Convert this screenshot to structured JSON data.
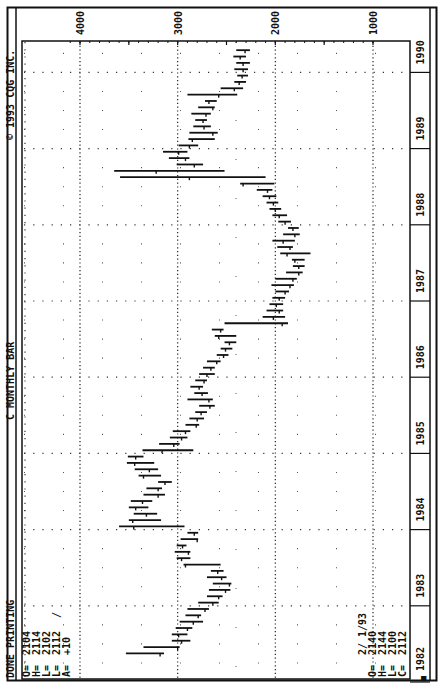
{
  "header": {
    "status": "DONE PRINTING",
    "title": "C MONTHLY BAR",
    "copyright": "© 1993 CQG INC."
  },
  "quote_current": {
    "labels": [
      "O=",
      "H=",
      "L=",
      "L=",
      "A="
    ],
    "values": [
      "2104",
      "2114",
      "2102",
      "2112",
      "+10"
    ],
    "tick_mark": "/"
  },
  "quote_cursor": {
    "date": "2/ 1/93",
    "labels": [
      "O=",
      "H=",
      "L=",
      "C="
    ],
    "values": [
      "2140",
      "2144",
      "2100",
      "2112"
    ]
  },
  "corner_marker": "■",
  "chart_data": {
    "type": "ohlc-bar",
    "title": "C MONTHLY BAR",
    "orientation": "rotated 90° counter-clockwise (price axis across top, time axis along right edge)",
    "xlabel": "Year",
    "ylabel": "Price",
    "ylim": [
      1000,
      4100
    ],
    "price_ticks": [
      4000,
      3000,
      2000,
      1000
    ],
    "year_ticks": [
      "1982",
      "1983",
      "1984",
      "1985",
      "1986",
      "1987",
      "1988",
      "1989",
      "1990",
      "1991",
      "1992",
      "1993"
    ],
    "grid": "dotted",
    "months": [
      {
        "t": "1982-05",
        "h": 3530,
        "l": 3140,
        "c": 3180
      },
      {
        "t": "1982-06",
        "h": 3350,
        "l": 2980,
        "c": 3000
      },
      {
        "t": "1982-07",
        "h": 3060,
        "l": 2870,
        "c": 2960
      },
      {
        "t": "1982-08",
        "h": 3060,
        "l": 2900,
        "c": 2990
      },
      {
        "t": "1982-09",
        "h": 3020,
        "l": 2850,
        "c": 2900
      },
      {
        "t": "1982-10",
        "h": 2980,
        "l": 2740,
        "c": 2840
      },
      {
        "t": "1982-11",
        "h": 2920,
        "l": 2760,
        "c": 2790
      },
      {
        "t": "1982-12",
        "h": 2900,
        "l": 2680,
        "c": 2720
      },
      {
        "t": "1983-01",
        "h": 2790,
        "l": 2580,
        "c": 2640
      },
      {
        "t": "1983-02",
        "h": 2700,
        "l": 2540,
        "c": 2580
      },
      {
        "t": "1983-03",
        "h": 2680,
        "l": 2460,
        "c": 2510
      },
      {
        "t": "1983-04",
        "h": 2640,
        "l": 2450,
        "c": 2470
      },
      {
        "t": "1983-05",
        "h": 2700,
        "l": 2500,
        "c": 2550
      },
      {
        "t": "1983-06",
        "h": 2660,
        "l": 2530,
        "c": 2590
      },
      {
        "t": "1983-07",
        "h": 2940,
        "l": 2560,
        "c": 2920
      },
      {
        "t": "1983-08",
        "h": 3010,
        "l": 2870,
        "c": 2960
      },
      {
        "t": "1983-09",
        "h": 3030,
        "l": 2870,
        "c": 2890
      },
      {
        "t": "1983-10",
        "h": 3010,
        "l": 2910,
        "c": 2950
      },
      {
        "t": "1983-11",
        "h": 2970,
        "l": 2790,
        "c": 2800
      },
      {
        "t": "1983-12",
        "h": 2900,
        "l": 2790,
        "c": 2830
      },
      {
        "t": "1984-01",
        "h": 3600,
        "l": 2930,
        "c": 3450
      },
      {
        "t": "1984-02",
        "h": 3500,
        "l": 3170,
        "c": 3460
      },
      {
        "t": "1984-03",
        "h": 3450,
        "l": 3210,
        "c": 3320
      },
      {
        "t": "1984-04",
        "h": 3500,
        "l": 3300,
        "c": 3430
      },
      {
        "t": "1984-05",
        "h": 3480,
        "l": 3260,
        "c": 3360
      },
      {
        "t": "1984-06",
        "h": 3350,
        "l": 3130,
        "c": 3200
      },
      {
        "t": "1984-07",
        "h": 3320,
        "l": 3160,
        "c": 3200
      },
      {
        "t": "1984-08",
        "h": 3200,
        "l": 3060,
        "c": 3130
      },
      {
        "t": "1984-09",
        "h": 3400,
        "l": 3170,
        "c": 3350
      },
      {
        "t": "1984-10",
        "h": 3440,
        "l": 3200,
        "c": 3290
      },
      {
        "t": "1984-11",
        "h": 3520,
        "l": 3240,
        "c": 3440
      },
      {
        "t": "1984-12",
        "h": 3510,
        "l": 3350,
        "c": 3430
      },
      {
        "t": "1985-01",
        "h": 3360,
        "l": 2840,
        "c": 3160
      },
      {
        "t": "1985-02",
        "h": 3190,
        "l": 2980,
        "c": 3040
      },
      {
        "t": "1985-03",
        "h": 3080,
        "l": 2900,
        "c": 2960
      },
      {
        "t": "1985-04",
        "h": 3050,
        "l": 2870,
        "c": 2920
      },
      {
        "t": "1985-05",
        "h": 2920,
        "l": 2780,
        "c": 2810
      },
      {
        "t": "1985-06",
        "h": 2880,
        "l": 2730,
        "c": 2800
      },
      {
        "t": "1985-07",
        "h": 2820,
        "l": 2700,
        "c": 2760
      },
      {
        "t": "1985-08",
        "h": 2780,
        "l": 2620,
        "c": 2670
      },
      {
        "t": "1985-09",
        "h": 2900,
        "l": 2640,
        "c": 2680
      },
      {
        "t": "1985-10",
        "h": 2830,
        "l": 2690,
        "c": 2750
      },
      {
        "t": "1985-11",
        "h": 2870,
        "l": 2740,
        "c": 2780
      },
      {
        "t": "1985-12",
        "h": 2820,
        "l": 2700,
        "c": 2730
      },
      {
        "t": "1986-01",
        "h": 2780,
        "l": 2620,
        "c": 2700
      },
      {
        "t": "1986-02",
        "h": 2740,
        "l": 2620,
        "c": 2660
      },
      {
        "t": "1986-03",
        "h": 2700,
        "l": 2560,
        "c": 2600
      },
      {
        "t": "1986-04",
        "h": 2600,
        "l": 2480,
        "c": 2530
      },
      {
        "t": "1986-05",
        "h": 2560,
        "l": 2440,
        "c": 2510
      },
      {
        "t": "1986-06",
        "h": 2520,
        "l": 2400,
        "c": 2470
      },
      {
        "t": "1986-07",
        "h": 2620,
        "l": 2400,
        "c": 2580
      },
      {
        "t": "1986-08",
        "h": 2650,
        "l": 2530,
        "c": 2560
      },
      {
        "t": "1986-09",
        "h": 2520,
        "l": 1870,
        "c": 1930
      },
      {
        "t": "1986-10",
        "h": 2130,
        "l": 1900,
        "c": 2020
      },
      {
        "t": "1986-11",
        "h": 2090,
        "l": 1920,
        "c": 1960
      },
      {
        "t": "1986-12",
        "h": 2060,
        "l": 1920,
        "c": 1990
      },
      {
        "t": "1987-01",
        "h": 2030,
        "l": 1900,
        "c": 1960
      },
      {
        "t": "1987-02",
        "h": 2000,
        "l": 1860,
        "c": 1900
      },
      {
        "t": "1987-03",
        "h": 2040,
        "l": 1810,
        "c": 1850
      },
      {
        "t": "1987-04",
        "h": 2000,
        "l": 1780,
        "c": 1820
      },
      {
        "t": "1987-05",
        "h": 1890,
        "l": 1720,
        "c": 1760
      },
      {
        "t": "1987-06",
        "h": 1820,
        "l": 1700,
        "c": 1760
      },
      {
        "t": "1987-07",
        "h": 1830,
        "l": 1700,
        "c": 1800
      },
      {
        "t": "1987-08",
        "h": 1950,
        "l": 1640,
        "c": 1880
      },
      {
        "t": "1987-09",
        "h": 1980,
        "l": 1820,
        "c": 1850
      },
      {
        "t": "1987-10",
        "h": 2030,
        "l": 1800,
        "c": 1920
      },
      {
        "t": "1987-11",
        "h": 1920,
        "l": 1750,
        "c": 1800
      },
      {
        "t": "1987-12",
        "h": 1870,
        "l": 1760,
        "c": 1820
      },
      {
        "t": "1988-01",
        "h": 1970,
        "l": 1840,
        "c": 1900
      },
      {
        "t": "1988-02",
        "h": 2030,
        "l": 1880,
        "c": 1960
      },
      {
        "t": "1988-03",
        "h": 2060,
        "l": 1940,
        "c": 2000
      },
      {
        "t": "1988-04",
        "h": 2090,
        "l": 1970,
        "c": 2020
      },
      {
        "t": "1988-05",
        "h": 2130,
        "l": 1990,
        "c": 2060
      },
      {
        "t": "1988-06",
        "h": 2190,
        "l": 2030,
        "c": 2080
      },
      {
        "t": "1988-07",
        "h": 2360,
        "l": 2010,
        "c": 2330
      },
      {
        "t": "1988-08",
        "h": 3590,
        "l": 2100,
        "c": 2880
      },
      {
        "t": "1988-09",
        "h": 3650,
        "l": 2520,
        "c": 3220
      },
      {
        "t": "1988-10",
        "h": 3010,
        "l": 2740,
        "c": 2830
      },
      {
        "t": "1988-11",
        "h": 3090,
        "l": 2880,
        "c": 2920
      },
      {
        "t": "1988-12",
        "h": 3150,
        "l": 2900,
        "c": 2990
      },
      {
        "t": "1989-01",
        "h": 2990,
        "l": 2790,
        "c": 2880
      },
      {
        "t": "1989-02",
        "h": 2890,
        "l": 2620,
        "c": 2850
      },
      {
        "t": "1989-03",
        "h": 2880,
        "l": 2590,
        "c": 2640
      },
      {
        "t": "1989-04",
        "h": 2840,
        "l": 2660,
        "c": 2730
      },
      {
        "t": "1989-05",
        "h": 2820,
        "l": 2700,
        "c": 2740
      },
      {
        "t": "1989-06",
        "h": 2860,
        "l": 2660,
        "c": 2710
      },
      {
        "t": "1989-07",
        "h": 2790,
        "l": 2620,
        "c": 2640
      },
      {
        "t": "1989-08",
        "h": 2720,
        "l": 2600,
        "c": 2680
      },
      {
        "t": "1989-09",
        "h": 2900,
        "l": 2390,
        "c": 2580
      },
      {
        "t": "1989-10",
        "h": 2560,
        "l": 2330,
        "c": 2420
      },
      {
        "t": "1989-11",
        "h": 2420,
        "l": 2300,
        "c": 2370
      },
      {
        "t": "1989-12",
        "h": 2390,
        "l": 2280,
        "c": 2340
      },
      {
        "t": "1990-01",
        "h": 2420,
        "l": 2280,
        "c": 2330
      },
      {
        "t": "1990-02",
        "h": 2400,
        "l": 2260,
        "c": 2330
      },
      {
        "t": "1990-03",
        "h": 2430,
        "l": 2300,
        "c": 2360
      },
      {
        "t": "1990-04",
        "h": 2400,
        "l": 2260,
        "c": 2310
      },
      {
        "t": "1990-05",
        "h": 2560,
        "l": 2330,
        "c": 2500
      },
      {
        "t": "1990-06",
        "h": 2760,
        "l": 2480,
        "c": 2730
      },
      {
        "t": "1990-07",
        "h": 2810,
        "l": 2600,
        "c": 2670
      },
      {
        "t": "1990-08",
        "h": 2720,
        "l": 2530,
        "c": 2700
      },
      {
        "t": "1990-09",
        "h": 3000,
        "l": 2590,
        "c": 2640
      },
      {
        "t": "1990-10",
        "h": 2700,
        "l": 2420,
        "c": 2450
      },
      {
        "t": "1990-11",
        "h": 2490,
        "l": 2350,
        "c": 2390
      },
      {
        "t": "1990-12",
        "h": 2450,
        "l": 2310,
        "c": 2360
      },
      {
        "t": "1991-01",
        "h": 2400,
        "l": 2180,
        "c": 2230
      },
      {
        "t": "1991-02",
        "h": 2280,
        "l": 2170,
        "c": 2200
      },
      {
        "t": "1991-03",
        "h": 2300,
        "l": 2150,
        "c": 2230
      },
      {
        "t": "1991-04",
        "h": 2390,
        "l": 2210,
        "c": 2260
      },
      {
        "t": "1991-05",
        "h": 2460,
        "l": 2300,
        "c": 2400
      },
      {
        "t": "1991-06",
        "h": 2460,
        "l": 2320,
        "c": 2380
      },
      {
        "t": "1991-07",
        "h": 2510,
        "l": 2340,
        "c": 2400
      },
      {
        "t": "1991-08",
        "h": 2600,
        "l": 2300,
        "c": 2340
      },
      {
        "t": "1991-09",
        "h": 2600,
        "l": 2390,
        "c": 2530
      },
      {
        "t": "1991-10",
        "h": 2620,
        "l": 2420,
        "c": 2520
      },
      {
        "t": "1991-11",
        "h": 2520,
        "l": 2330,
        "c": 2420
      },
      {
        "t": "1991-12",
        "h": 2460,
        "l": 2330,
        "c": 2380
      },
      {
        "t": "1992-01",
        "h": 2500,
        "l": 2360,
        "c": 2470
      },
      {
        "t": "1992-02",
        "h": 2610,
        "l": 2420,
        "c": 2470
      },
      {
        "t": "1992-03",
        "h": 2590,
        "l": 2430,
        "c": 2500
      },
      {
        "t": "1992-04",
        "h": 2600,
        "l": 2480,
        "c": 2550
      },
      {
        "t": "1992-05",
        "h": 2590,
        "l": 2440,
        "c": 2500
      },
      {
        "t": "1992-06",
        "h": 2520,
        "l": 2360,
        "c": 2390
      },
      {
        "t": "1992-07",
        "h": 2420,
        "l": 2330,
        "c": 2400
      },
      {
        "t": "1992-08",
        "h": 2380,
        "l": 2290,
        "c": 2320
      },
      {
        "t": "1992-09",
        "h": 2450,
        "l": 2230,
        "c": 2260
      },
      {
        "t": "1992-10",
        "h": 2270,
        "l": 2140,
        "c": 2180
      },
      {
        "t": "1992-11",
        "h": 2270,
        "l": 2140,
        "c": 2200
      },
      {
        "t": "1992-12",
        "h": 2230,
        "l": 2090,
        "c": 2140
      },
      {
        "t": "1993-01",
        "h": 2230,
        "l": 2090,
        "c": 2140
      },
      {
        "t": "1993-02",
        "h": 2144,
        "l": 2100,
        "c": 2112
      }
    ]
  }
}
